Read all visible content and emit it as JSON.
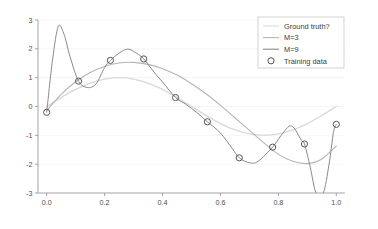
{
  "chart_data": {
    "type": "line",
    "title": "",
    "xlabel": "",
    "ylabel": "",
    "xlim": [
      -0.03,
      1.03
    ],
    "ylim": [
      -3,
      3
    ],
    "xticks": [
      "0.0",
      "0.2",
      "0.4",
      "0.6",
      "0.8",
      "1.0"
    ],
    "xtick_values": [
      0.0,
      0.2,
      0.4,
      0.6,
      0.8,
      1.0
    ],
    "yticks": [
      "3",
      "2",
      "1",
      "0",
      "-1",
      "-2",
      "-3"
    ],
    "ytick_values": [
      3,
      2,
      1,
      0,
      -1,
      -2,
      -3
    ],
    "grid": true,
    "legend_position": "upper right",
    "legend": [
      {
        "label": "Ground truth?",
        "type": "line",
        "color": "#d9d9d9"
      },
      {
        "label": "M=3",
        "type": "line",
        "color": "#b4b4b4"
      },
      {
        "label": "M=9",
        "type": "line",
        "color": "#8a8a8a"
      },
      {
        "label": "Training data",
        "type": "marker",
        "color": "#555555"
      }
    ],
    "series": [
      {
        "name": "Ground truth?",
        "color": "#d9d9d9",
        "x": [
          0.0,
          0.05,
          0.1,
          0.15,
          0.2,
          0.25,
          0.3,
          0.35,
          0.4,
          0.45,
          0.5,
          0.55,
          0.6,
          0.65,
          0.7,
          0.75,
          0.8,
          0.85,
          0.9,
          0.95,
          1.0
        ],
        "values": [
          0.0,
          0.31,
          0.59,
          0.81,
          0.95,
          1.0,
          0.95,
          0.81,
          0.59,
          0.31,
          0.0,
          -0.31,
          -0.59,
          -0.81,
          -0.95,
          -1.0,
          -0.95,
          -0.81,
          -0.59,
          -0.31,
          0.0
        ]
      },
      {
        "name": "M=3",
        "color": "#b4b4b4",
        "x": [
          0.0,
          0.05,
          0.1,
          0.15,
          0.2,
          0.25,
          0.3,
          0.35,
          0.4,
          0.45,
          0.5,
          0.55,
          0.6,
          0.65,
          0.7,
          0.75,
          0.8,
          0.85,
          0.9,
          0.95,
          1.0
        ],
        "values": [
          -0.14,
          0.42,
          0.86,
          1.18,
          1.39,
          1.51,
          1.53,
          1.46,
          1.31,
          1.09,
          0.79,
          0.44,
          0.04,
          -0.39,
          -0.83,
          -1.26,
          -1.66,
          -1.9,
          -1.98,
          -1.82,
          -1.37
        ]
      },
      {
        "name": "M=9",
        "color": "#8a8a8a",
        "x": [
          0.0,
          0.02,
          0.04,
          0.06,
          0.08,
          0.11,
          0.14,
          0.17,
          0.2,
          0.22,
          0.25,
          0.28,
          0.31,
          0.335,
          0.37,
          0.4,
          0.445,
          0.48,
          0.52,
          0.555,
          0.6,
          0.64,
          0.665,
          0.7,
          0.73,
          0.78,
          0.81,
          0.845,
          0.88,
          0.89,
          0.91,
          0.93,
          0.955,
          0.975,
          0.99,
          1.0
        ],
        "values": [
          -0.2,
          1.6,
          2.78,
          2.5,
          1.75,
          0.88,
          0.66,
          0.78,
          1.35,
          1.6,
          1.85,
          1.99,
          1.85,
          1.65,
          1.2,
          0.85,
          0.31,
          0.08,
          -0.22,
          -0.53,
          -0.92,
          -1.45,
          -1.78,
          -1.95,
          -1.9,
          -1.41,
          -1.0,
          -0.67,
          -1.18,
          -1.3,
          -2.1,
          -3.0,
          -3.0,
          -2.0,
          -0.9,
          -0.62
        ]
      }
    ],
    "training_data": {
      "name": "Training data",
      "x": [
        0.0,
        0.11,
        0.22,
        0.335,
        0.445,
        0.555,
        0.665,
        0.78,
        0.89,
        1.0
      ],
      "values": [
        -0.2,
        0.88,
        1.6,
        1.65,
        0.31,
        -0.53,
        -1.78,
        -1.41,
        -1.3,
        -0.62
      ]
    }
  }
}
